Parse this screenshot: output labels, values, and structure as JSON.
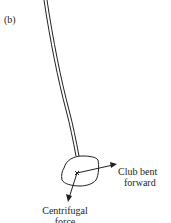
{
  "panel_label": "(b)",
  "labels": {
    "club_line1": "Club bent",
    "club_line2": "forward",
    "force_line1": "Centrifugal",
    "force_line2": "force"
  },
  "colors": {
    "ink": "#231f20",
    "background": "#ffffff"
  }
}
